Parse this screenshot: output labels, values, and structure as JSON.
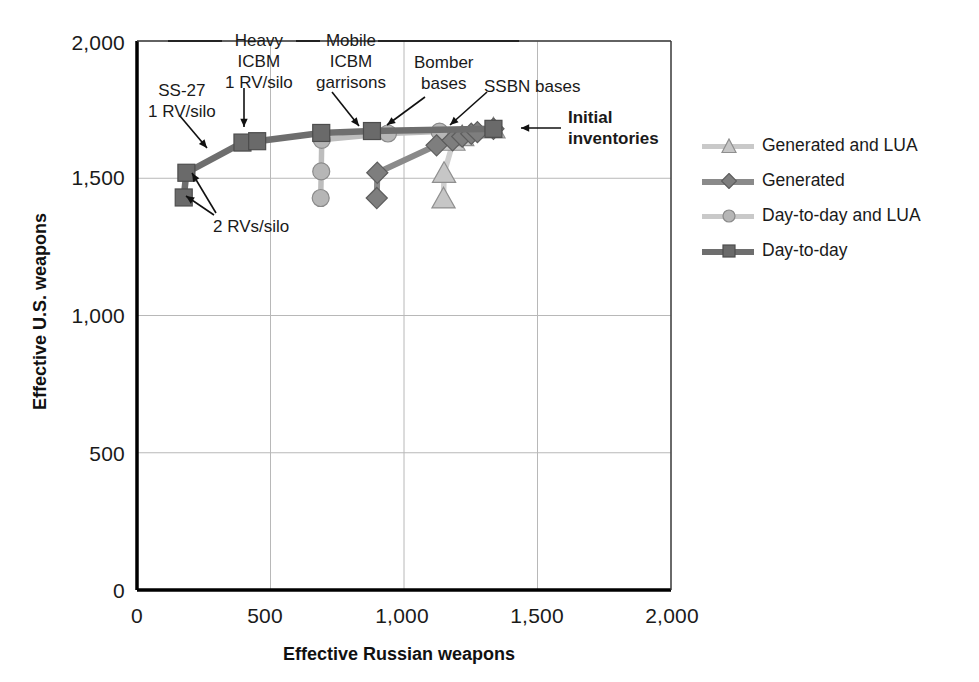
{
  "figure": {
    "background": "#ffffff",
    "plot": {
      "left": 137,
      "top": 41,
      "right": 671,
      "bottom": 590
    }
  },
  "axes": {
    "x": {
      "label": "Effective Russian weapons",
      "ticks": [
        "0",
        "500",
        "1,000",
        "1,500",
        "2,000"
      ],
      "tick_values": [
        0,
        500,
        1000,
        1500,
        2000
      ],
      "min": 0,
      "max": 2000
    },
    "y": {
      "label": "Effective U.S. weapons",
      "ticks": [
        "0",
        "500",
        "1,000",
        "1,500",
        "2,000"
      ],
      "tick_values": [
        0,
        500,
        1000,
        1500,
        2000
      ],
      "min": 0,
      "max": 2000
    }
  },
  "colors": {
    "axis": "#000000",
    "grid": "#b8b8b8",
    "text": "#1a1a1a",
    "day_to_day": "#6e6e6e",
    "day_to_day_lua": "#bdbdbd",
    "generated": "#8a8a8a",
    "generated_lua": "#cfcfcf",
    "marker_edge": "#5a5a5a"
  },
  "legend": {
    "position": "right",
    "items": [
      {
        "label": "Generated and LUA",
        "marker": "triangle",
        "line_color": "#c9c9c9",
        "marker_fill": "#c6c6c6",
        "marker_edge": "#8f8f8f"
      },
      {
        "label": "Generated",
        "marker": "diamond",
        "line_color": "#8a8a8a",
        "marker_fill": "#7e7e7e",
        "marker_edge": "#5d5d5d"
      },
      {
        "label": "Day-to-day and LUA",
        "marker": "circle",
        "line_color": "#c9c9c9",
        "marker_fill": "#b6b6b6",
        "marker_edge": "#8a8a8a"
      },
      {
        "label": "Day-to-day",
        "marker": "square",
        "line_color": "#6e6e6e",
        "marker_fill": "#6a6a6a",
        "marker_edge": "#4d4d4d"
      }
    ]
  },
  "annotations": [
    {
      "name": "ss27-1rv-silo",
      "text": "SS-27\n1 RV/silo",
      "x": 148,
      "y": 80,
      "align": "center",
      "bold": false
    },
    {
      "name": "heavy-icbm-1rv-silo",
      "text": "Heavy\nICBM\n1 RV/silo",
      "x": 225,
      "y": 30,
      "align": "center",
      "bold": false
    },
    {
      "name": "mobile-icbm-garrisons",
      "text": "Mobile\nICBM\ngarrisons",
      "x": 316,
      "y": 30,
      "align": "center",
      "bold": false
    },
    {
      "name": "bomber-bases",
      "text": "Bomber\nbases",
      "x": 414,
      "y": 52,
      "align": "center",
      "bold": false
    },
    {
      "name": "ssbn-bases",
      "text": "SSBN bases",
      "x": 484,
      "y": 76,
      "align": "left",
      "bold": false
    },
    {
      "name": "initial-inventories",
      "text": "Initial\ninventories",
      "x": 568,
      "y": 107,
      "align": "left",
      "bold": true
    },
    {
      "name": "two-rvs-silo",
      "text": "2 RVs/silo",
      "x": 213,
      "y": 216,
      "align": "left",
      "bold": false
    }
  ],
  "chart_data": {
    "type": "scatter",
    "title": "",
    "xlabel": "Effective Russian weapons",
    "ylabel": "Effective U.S. weapons",
    "xlim": [
      0,
      2000
    ],
    "ylim": [
      0,
      2000
    ],
    "grid": true,
    "legend_position": "right",
    "series": [
      {
        "name": "Day-to-day",
        "marker": "square",
        "color": "#6e6e6e",
        "points": [
          {
            "x": 175,
            "y": 1430
          },
          {
            "x": 185,
            "y": 1520
          },
          {
            "x": 395,
            "y": 1630
          },
          {
            "x": 450,
            "y": 1635
          },
          {
            "x": 690,
            "y": 1665
          },
          {
            "x": 880,
            "y": 1672
          },
          {
            "x": 1335,
            "y": 1680
          }
        ]
      },
      {
        "name": "Day-to-day and LUA",
        "marker": "circle",
        "color": "#bdbdbd",
        "points": [
          {
            "x": 688,
            "y": 1428
          },
          {
            "x": 690,
            "y": 1525
          },
          {
            "x": 692,
            "y": 1640
          },
          {
            "x": 940,
            "y": 1663
          },
          {
            "x": 1133,
            "y": 1670
          },
          {
            "x": 1335,
            "y": 1680
          }
        ]
      },
      {
        "name": "Generated",
        "marker": "diamond",
        "color": "#8a8a8a",
        "points": [
          {
            "x": 898,
            "y": 1428
          },
          {
            "x": 900,
            "y": 1520
          },
          {
            "x": 1122,
            "y": 1620
          },
          {
            "x": 1182,
            "y": 1638
          },
          {
            "x": 1218,
            "y": 1652
          },
          {
            "x": 1252,
            "y": 1662
          },
          {
            "x": 1275,
            "y": 1668
          },
          {
            "x": 1335,
            "y": 1680
          }
        ]
      },
      {
        "name": "Generated and LUA",
        "marker": "triangle",
        "color": "#cfcfcf",
        "points": [
          {
            "x": 1148,
            "y": 1425
          },
          {
            "x": 1150,
            "y": 1518
          },
          {
            "x": 1185,
            "y": 1635
          },
          {
            "x": 1218,
            "y": 1652
          },
          {
            "x": 1335,
            "y": 1680
          }
        ]
      }
    ]
  }
}
